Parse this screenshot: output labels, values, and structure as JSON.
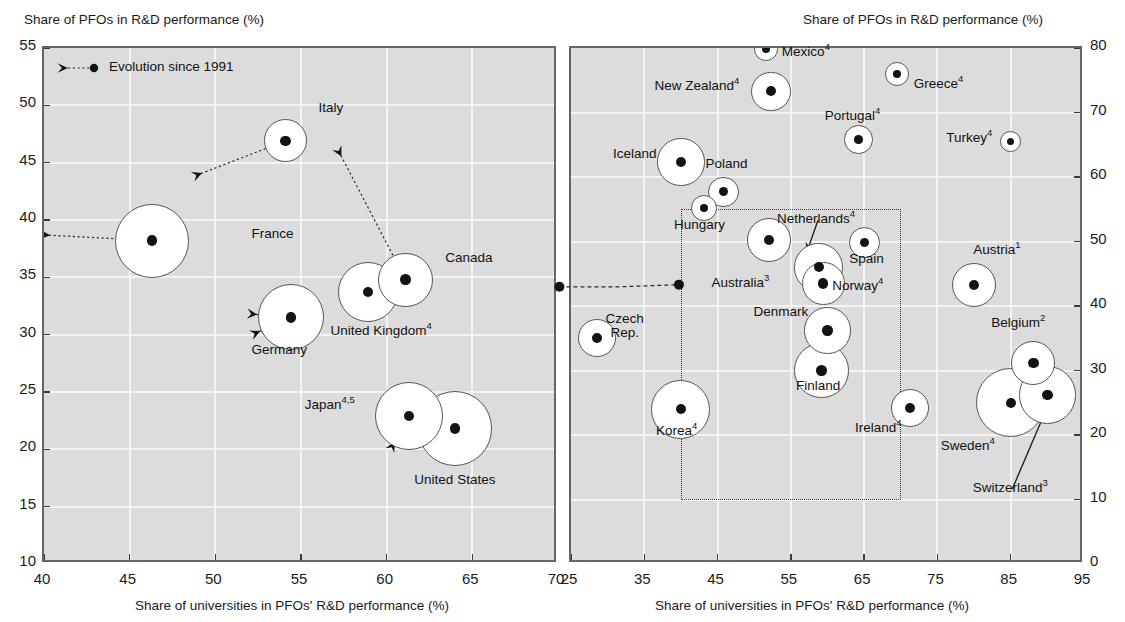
{
  "figure": {
    "background": "#ffffff",
    "plot_background": "#dcdcdc",
    "grid_color": "#f4f4f4",
    "border_color": "#666666",
    "marker_color": "#131313",
    "bubble_fill": "#ffffff",
    "bubble_stroke": "#555555"
  },
  "legend": {
    "label": "Evolution since 1991"
  },
  "chart_data": [
    {
      "panel": "left",
      "type": "scatter",
      "title": "",
      "ylabel": "Share of PFOs in R&D performance (%)",
      "xlabel": "Share of universities in PFOs' R&D performance (%)",
      "xlim": [
        40,
        70
      ],
      "ylim": [
        10,
        55
      ],
      "xticks": [
        40,
        45,
        50,
        55,
        60,
        65,
        70
      ],
      "yticks": [
        10,
        15,
        20,
        25,
        30,
        35,
        40,
        45,
        50,
        55
      ],
      "grid": true,
      "legend_position": "top-left",
      "note": "Bubble area is proportional to total R&D expenditure; dashed arrows show evolution since 1991",
      "points": [
        {
          "name": "France",
          "footnote": "",
          "x": 46.3,
          "y": 38.2,
          "size": 5.0,
          "label_x": 52.0,
          "label_y": 38.4,
          "label_align": "left",
          "arrow_from_x": 40.0,
          "arrow_from_y": 38.7
        },
        {
          "name": "Italy",
          "footnote": "",
          "x": 54.1,
          "y": 46.9,
          "size": 1.7,
          "label_x": 55.9,
          "label_y": 49.4,
          "label_align": "left",
          "arrow_from_x": 48.9,
          "arrow_from_y": 43.9
        },
        {
          "name": "Germany",
          "footnote": "",
          "x": 54.4,
          "y": 31.5,
          "size": 4.0,
          "label_x": 52.0,
          "label_y": 28.3,
          "label_align": "left",
          "arrow_from_x": 52.1,
          "arrow_from_y": 31.8,
          "arrow2_from_x": 52.3,
          "arrow2_from_y": 30.1
        },
        {
          "name": "United Kingdom",
          "footnote": "4",
          "x": 58.9,
          "y": 33.7,
          "size": 3.3,
          "label_x": 56.6,
          "label_y": 30.2,
          "label_align": "left"
        },
        {
          "name": "Canada",
          "footnote": "",
          "x": 61.1,
          "y": 34.8,
          "size": 2.7,
          "label_x": 63.3,
          "label_y": 36.3,
          "label_align": "left",
          "arrow_from_x": 57.2,
          "arrow_from_y": 46.0
        },
        {
          "name": "Japan",
          "footnote": "4,5",
          "x": 61.3,
          "y": 22.9,
          "size": 4.3,
          "label_x": 55.1,
          "label_y": 23.8,
          "label_align": "left",
          "arrow_from_x": 60.2,
          "arrow_from_y": 24.8,
          "arrow2_from_x": 60.3,
          "arrow2_from_y": 20.2
        },
        {
          "name": "United States",
          "footnote": "",
          "x": 64.0,
          "y": 21.8,
          "size": 5.1,
          "label_x": 61.5,
          "label_y": 17.0,
          "label_align": "left"
        }
      ],
      "oecd_connector": {
        "x": 70.2,
        "y": 34.0
      }
    },
    {
      "panel": "right",
      "type": "scatter",
      "title": "",
      "ylabel": "Share of PFOs in R&D performance (%)",
      "xlabel": "Share of universities in PFOs' R&D performance (%)",
      "xlim": [
        25,
        95
      ],
      "ylim": [
        0,
        80
      ],
      "xticks": [
        25,
        35,
        45,
        55,
        65,
        75,
        85,
        95
      ],
      "yticks": [
        0,
        10,
        20,
        30,
        40,
        50,
        60,
        70,
        80
      ],
      "grid": true,
      "inset_box": {
        "x0": 40,
        "x1": 70,
        "y0": 10,
        "y1": 55
      },
      "note": "Dotted rectangle marks the zoomed region shown in the left panel",
      "points": [
        {
          "name": "Mexico",
          "footnote": "4",
          "x": 51.6,
          "y": 79.8,
          "size": 0.55,
          "label_x": 53.5,
          "label_y": 79.3,
          "label_align": "left"
        },
        {
          "name": "Greece",
          "footnote": "4",
          "x": 69.5,
          "y": 76.0,
          "size": 0.55,
          "label_x": 71.5,
          "label_y": 74.3,
          "label_align": "left"
        },
        {
          "name": "New Zealand",
          "footnote": "4",
          "x": 52.3,
          "y": 73.3,
          "size": 1.5,
          "label_x": 48.8,
          "label_y": 74.0,
          "label_align": "right"
        },
        {
          "name": "Portugal",
          "footnote": "4",
          "x": 64.2,
          "y": 65.8,
          "size": 0.8,
          "label_x": 63.7,
          "label_y": 69.3,
          "label_align": "center"
        },
        {
          "name": "Turkey",
          "footnote": "4",
          "x": 85.0,
          "y": 65.5,
          "size": 0.45,
          "label_x": 83.3,
          "label_y": 65.9,
          "label_align": "right"
        },
        {
          "name": "Iceland",
          "footnote": "",
          "x": 40.0,
          "y": 62.3,
          "size": 2.2,
          "label_x": 37.5,
          "label_y": 62.9,
          "label_align": "right"
        },
        {
          "name": "Poland",
          "footnote": "",
          "x": 45.8,
          "y": 57.7,
          "size": 0.9,
          "label_x": 46.5,
          "label_y": 61.4,
          "label_align": "center"
        },
        {
          "name": "Hungary",
          "footnote": "",
          "x": 43.1,
          "y": 55.2,
          "size": 0.65,
          "label_x": 42.8,
          "label_y": 51.9,
          "label_align": "center"
        },
        {
          "name": "Australia",
          "footnote": "3",
          "x": 52.0,
          "y": 50.2,
          "size": 1.9,
          "label_x": 48.4,
          "label_y": 43.4,
          "label_align": "center"
        },
        {
          "name": "Spain",
          "footnote": "",
          "x": 65.0,
          "y": 49.8,
          "size": 0.95,
          "label_x": 65.6,
          "label_y": 46.6,
          "label_align": "center"
        },
        {
          "name": "Netherlands",
          "footnote": "4",
          "x": 58.8,
          "y": 46.0,
          "size": 2.3,
          "label_x": 58.7,
          "label_y": 53.3,
          "label_align": "center",
          "arrow_to_x": 57.2,
          "arrow_to_y": 48.4
        },
        {
          "name": "Norway",
          "footnote": "4",
          "x": 59.4,
          "y": 43.5,
          "size": 1.8,
          "label_x": 64.4,
          "label_y": 42.9,
          "label_align": "center"
        },
        {
          "name": "Austria",
          "footnote": "1",
          "x": 80.0,
          "y": 43.3,
          "size": 1.9,
          "label_x": 83.4,
          "label_y": 48.6,
          "label_align": "center"
        },
        {
          "name": "Denmark",
          "footnote": "",
          "x": 60.0,
          "y": 36.2,
          "size": 2.1,
          "label_x": 53.9,
          "label_y": 38.4,
          "label_align": "center"
        },
        {
          "name": "Czech Rep.",
          "footnote": "",
          "x": 28.5,
          "y": 35.0,
          "size": 1.4,
          "label_x": 32.6,
          "label_y": 37.4,
          "label_align": "center",
          "two_line": true
        },
        {
          "name": "Belgium",
          "footnote": "2",
          "x": 88.1,
          "y": 31.2,
          "size": 1.9,
          "label_x": 86.3,
          "label_y": 37.2,
          "label_align": "center"
        },
        {
          "name": "Finland",
          "footnote": "",
          "x": 59.2,
          "y": 30.0,
          "size": 2.9,
          "label_x": 59.0,
          "label_y": 27.0,
          "label_align": "center"
        },
        {
          "name": "Switzerland",
          "footnote": "3",
          "x": 90.0,
          "y": 26.2,
          "size": 3.2,
          "label_x": 85.2,
          "label_y": 11.6,
          "label_align": "center",
          "arrow_to_x": 89.6,
          "arrow_to_y": 23.3
        },
        {
          "name": "Sweden",
          "footnote": "4",
          "x": 85.0,
          "y": 25.0,
          "size": 4.7,
          "label_x": 79.4,
          "label_y": 18.1,
          "label_align": "center"
        },
        {
          "name": "Ireland",
          "footnote": "4",
          "x": 71.2,
          "y": 24.2,
          "size": 1.4,
          "label_x": 67.2,
          "label_y": 21.0,
          "label_align": "center"
        },
        {
          "name": "Korea",
          "footnote": "4",
          "x": 40.0,
          "y": 24.0,
          "size": 3.4,
          "label_x": 39.7,
          "label_y": 20.4,
          "label_align": "center"
        }
      ],
      "oecd_connector": {
        "x": 40.0,
        "y": 43.0
      }
    }
  ]
}
